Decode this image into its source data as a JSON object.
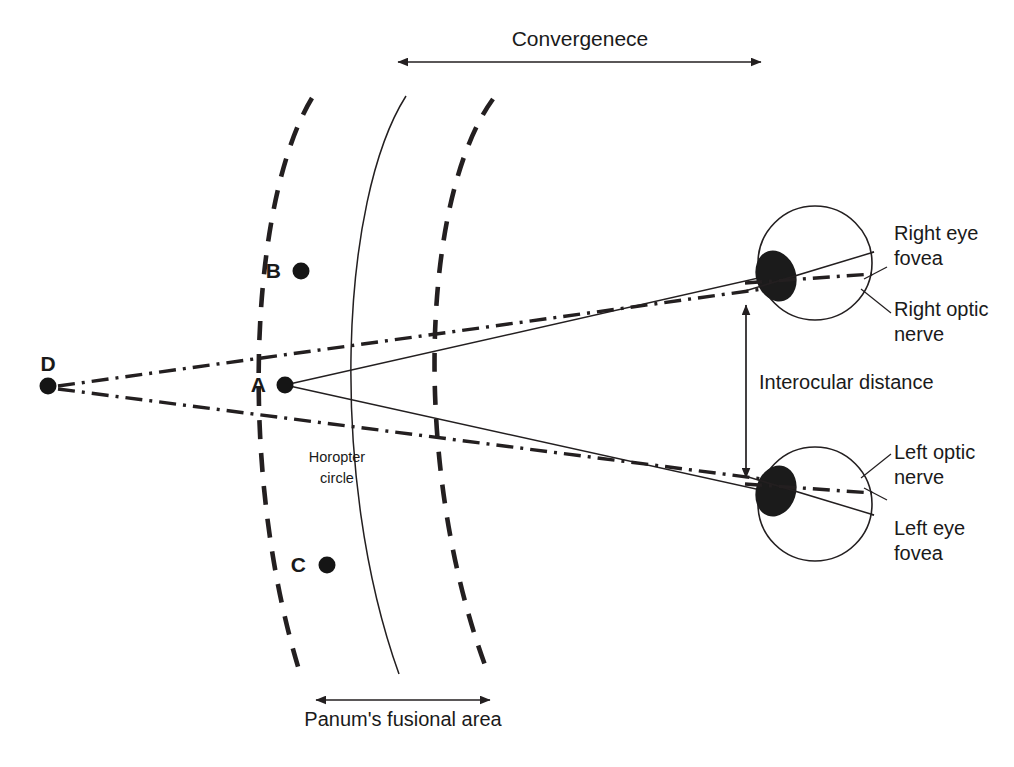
{
  "figure": {
    "title": "Convergenece",
    "background_color": "#ffffff",
    "ink_color": "#231f20"
  },
  "labels": {
    "convergence": "Convergenece",
    "panum": "Panum's fusional area",
    "interocular": "Interocular distance",
    "horopter_line1": "Horopter",
    "horopter_line2": "circle",
    "right_eye_fovea_line1": "Right eye",
    "right_eye_fovea_line2": "fovea",
    "right_optic_nerve_line1": "Right optic",
    "right_optic_nerve_line2": "nerve",
    "left_optic_nerve_line1": "Left optic",
    "left_optic_nerve_line2": "nerve",
    "left_eye_fovea_line1": "Left eye",
    "left_eye_fovea_line2": "fovea"
  },
  "points": [
    {
      "id": "A",
      "label": "A",
      "x": 285,
      "y": 385,
      "label_x": 266,
      "label_y": 392
    },
    {
      "id": "B",
      "label": "B",
      "x": 301,
      "y": 271,
      "label_x": 281,
      "label_y": 278
    },
    {
      "id": "C",
      "label": "C",
      "x": 327,
      "y": 565,
      "label_x": 306,
      "label_y": 572
    },
    {
      "id": "D",
      "label": "D",
      "x": 48,
      "y": 386,
      "label_x": 39,
      "label_y": 371
    }
  ],
  "eyes": [
    {
      "id": "right-eye",
      "circle": {
        "cx": 815,
        "cy": 263,
        "r": 57
      },
      "fovea": {
        "cx": 776,
        "cy": 276,
        "rx": 20,
        "ry": 26,
        "rotate": -18
      }
    },
    {
      "id": "left-eye",
      "circle": {
        "cx": 815,
        "cy": 504,
        "r": 57
      },
      "fovea": {
        "cx": 776,
        "cy": 491,
        "rx": 20,
        "ry": 26,
        "rotate": 18
      }
    }
  ],
  "measures": {
    "convergence_arrow": {
      "x1": 398,
      "x2": 761,
      "y": 62
    },
    "panum_arrow": {
      "x1": 316,
      "x2": 490,
      "y": 700
    },
    "interocular_arrow": {
      "x": 746,
      "y1": 305,
      "y2": 478
    }
  },
  "arcs": {
    "panum_near_dashed": "M 312 98 C 250 200, 237 470, 300 673",
    "horopter_solid": "M 406 96 C 340 200, 328 476, 399 674",
    "panum_far_dashed": "M 493 99 C 420 200, 412 474, 488 673"
  },
  "rays": {
    "a_to_right_eye": "M 285 385 L 874 252",
    "a_to_left_eye": "M 285 385 L 874 515",
    "d_to_right_eye": "M 58 386 L 872 274",
    "d_to_left_eye": "M 58 389 L 872 493"
  },
  "leaders": {
    "right_fovea": "M 864 279 L 886 268",
    "right_optic_nerve": "M 861 288 L 890 312",
    "left_fovea": "M 864 488 L 886 499",
    "left_optic_nerve": "M 861 479 L 890 455"
  },
  "text_positions": {
    "convergence": {
      "x": 580,
      "y": 46
    },
    "panum": {
      "x": 403,
      "y": 726
    },
    "interocular": {
      "x": 759,
      "y": 389
    },
    "horopter": {
      "x": 337,
      "y": 462
    },
    "right_eye_fovea": {
      "x": 894,
      "y": 240
    },
    "right_optic_nerve": {
      "x": 894,
      "y": 316
    },
    "left_optic_nerve": {
      "x": 894,
      "y": 459
    },
    "left_eye_fovea": {
      "x": 894,
      "y": 535
    }
  }
}
